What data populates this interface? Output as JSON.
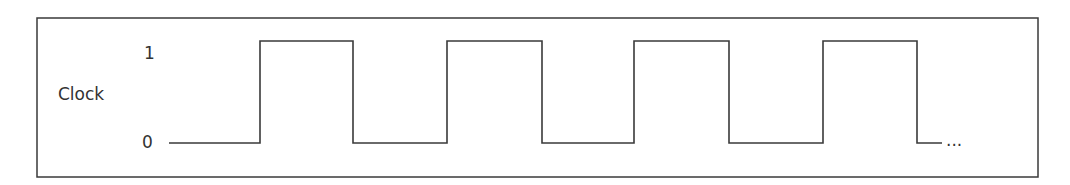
{
  "diagram": {
    "signal_label": "Clock",
    "high_label": "1",
    "low_label": "0",
    "continuation": "...",
    "colors": {
      "line": "#3a3a3a",
      "text": "#333333",
      "background": "#ffffff"
    },
    "waveform": {
      "type": "square-wave",
      "levels": [
        0,
        1
      ],
      "high_pulses": 4,
      "transitions_x": [
        260,
        353,
        447,
        542,
        634,
        729,
        823,
        917
      ]
    }
  }
}
